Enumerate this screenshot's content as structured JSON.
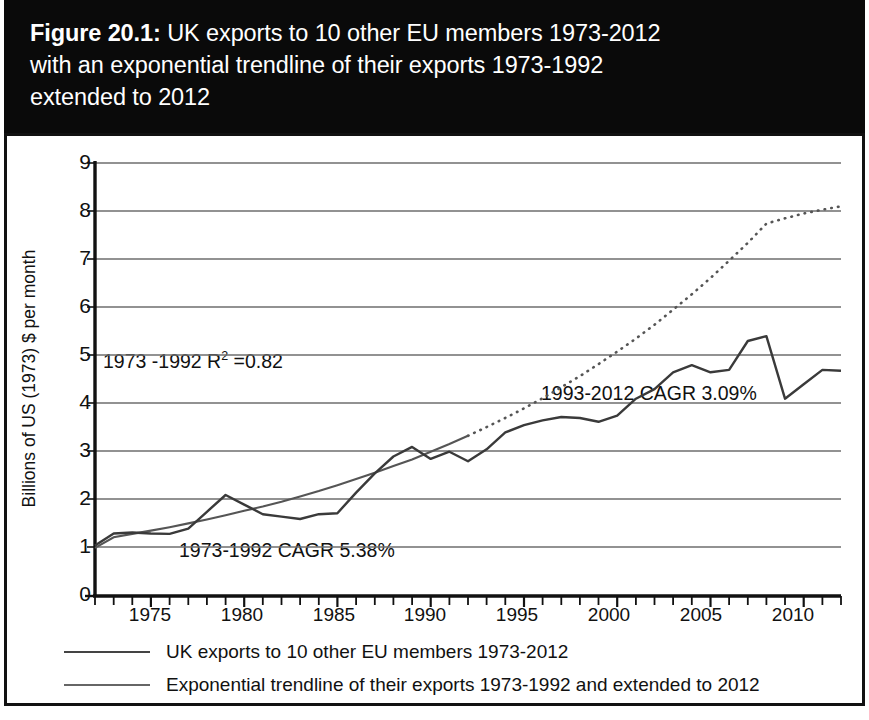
{
  "figure": {
    "number": "Figure 20.1:",
    "caption": " UK exports to 10 other EU members 1973-2012 with an exponential trendline of their exports 1973-1992 extended to 2012",
    "title_line1_bold": "Figure 20.1:",
    "title_line1_rest": " UK exports to 10 other EU members 1973-2012",
    "title_line2": "with an exponential trendline of their exports 1973-1992",
    "title_line3": "extended to 2012"
  },
  "colors": {
    "title_band": "#0a0a0a",
    "title_text": "#ffffff",
    "panel_border": "#111111",
    "grid": "#6e6e6e",
    "axis": "#111111",
    "series_exports": "#3a3a3a",
    "series_trendline": "#555555",
    "background": "#ffffff"
  },
  "axes": {
    "y_title": "Billions of US (1973) $ per month",
    "y_ticks": [
      "0",
      "1",
      "2",
      "3",
      "4",
      "5",
      "6",
      "7",
      "8",
      "9"
    ],
    "x_ticks": [
      "1975",
      "1980",
      "1985",
      "1990",
      "1995",
      "2000",
      "2005",
      "2010"
    ]
  },
  "annotations": [
    {
      "name": "r-squared",
      "text_prefix": "1973 -1992 R",
      "text_sup": "2",
      "text_suffix": " =0.82"
    },
    {
      "name": "cagr-early",
      "text": "1973-1992 CAGR 5.38%"
    },
    {
      "name": "cagr-late",
      "text": "1993-2012 CAGR 3.09%"
    }
  ],
  "legend": {
    "items": [
      {
        "label": "UK exports to 10 other EU members 1973-2012",
        "style": "solid"
      },
      {
        "label": "Exponential trendline of their exports 1973-1992 and extended to 2012",
        "style": "solid-thin"
      }
    ]
  },
  "chart_data": {
    "type": "line",
    "title": "UK exports to 10 other EU members 1973-2012 with an exponential trendline of their exports 1973-1992 extended to 2012",
    "xlabel": "",
    "ylabel": "Billions of US (1973) $ per month",
    "xlim": [
      1972,
      2012
    ],
    "ylim": [
      0,
      9
    ],
    "grid": "horizontal",
    "legend_position": "below-plot",
    "x_tick_values": [
      1975,
      1980,
      1985,
      1990,
      1995,
      2000,
      2005,
      2010
    ],
    "y_tick_values": [
      0,
      1,
      2,
      3,
      4,
      5,
      6,
      7,
      8,
      9
    ],
    "x": [
      1972,
      1973,
      1974,
      1975,
      1976,
      1977,
      1978,
      1979,
      1980,
      1981,
      1982,
      1983,
      1984,
      1985,
      1986,
      1987,
      1988,
      1989,
      1990,
      1991,
      1992,
      1993,
      1994,
      1995,
      1996,
      1997,
      1998,
      1999,
      2000,
      2001,
      2002,
      2003,
      2004,
      2005,
      2006,
      2007,
      2008,
      2009,
      2010,
      2011,
      2012
    ],
    "series": [
      {
        "name": "UK exports to 10 other EU members 1973-2012",
        "style": "solid",
        "values": [
          1.05,
          1.3,
          1.32,
          1.3,
          1.29,
          1.4,
          1.75,
          2.1,
          1.9,
          1.7,
          1.65,
          1.6,
          1.7,
          1.72,
          2.15,
          2.55,
          2.9,
          3.1,
          2.85,
          3.0,
          2.8,
          3.05,
          3.4,
          3.55,
          3.65,
          3.72,
          3.7,
          3.62,
          3.75,
          4.1,
          4.3,
          4.65,
          4.8,
          4.65,
          4.7,
          5.3,
          5.4,
          4.1,
          4.4,
          4.7,
          4.68
        ]
      },
      {
        "name": "Exponential trendline of their exports 1973-1992 and extended to 2012",
        "style": "solid-then-dotted",
        "solid_until": 1992,
        "values": [
          1.0,
          1.22,
          1.29,
          1.36,
          1.43,
          1.51,
          1.59,
          1.68,
          1.77,
          1.86,
          1.96,
          2.07,
          2.18,
          2.3,
          2.43,
          2.56,
          2.7,
          2.84,
          3.0,
          3.16,
          3.33,
          3.51,
          3.7,
          3.9,
          4.11,
          4.34,
          4.57,
          4.82,
          5.08,
          5.35,
          5.64,
          5.95,
          6.27,
          6.61,
          6.97,
          7.34,
          7.74,
          7.85,
          7.95,
          8.03,
          8.1
        ]
      }
    ],
    "annotation_values": {
      "r_squared": 0.82,
      "cagr_1973_1992_pct": 5.38,
      "cagr_1993_2012_pct": 3.09
    }
  }
}
